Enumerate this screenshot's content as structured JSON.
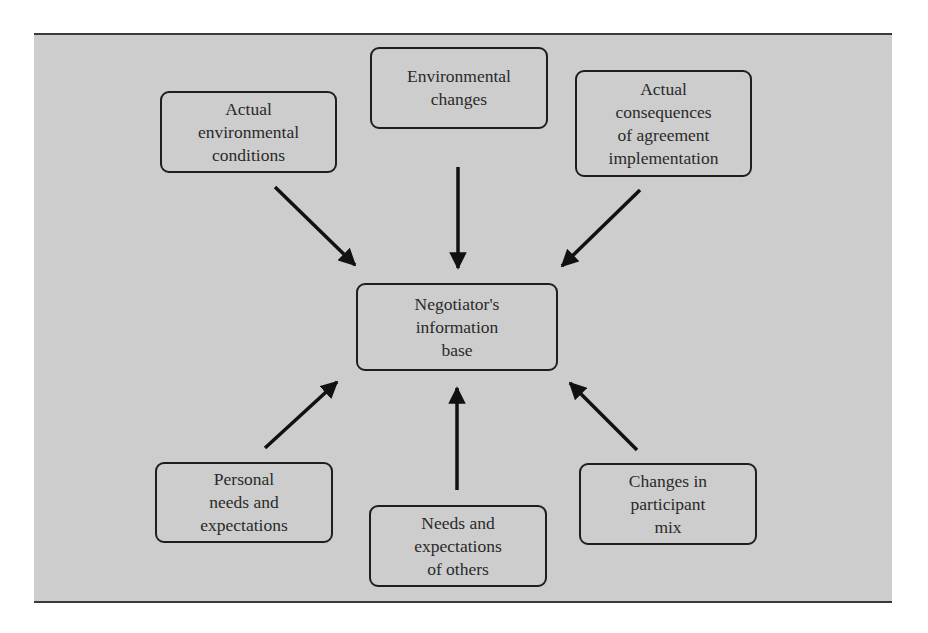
{
  "diagram": {
    "type": "hub-and-spoke flow diagram",
    "center": {
      "id": "info-base",
      "lines": [
        "Negotiator's",
        "information",
        "base"
      ]
    },
    "nodes": [
      {
        "id": "actual-env-conditions",
        "lines": [
          "Actual",
          "environmental",
          "conditions"
        ],
        "direction": "inbound"
      },
      {
        "id": "env-changes",
        "lines": [
          "Environmental",
          "changes"
        ],
        "direction": "inbound"
      },
      {
        "id": "actual-consequences",
        "lines": [
          "Actual",
          "consequences",
          "of agreement",
          "implementation"
        ],
        "direction": "inbound"
      },
      {
        "id": "personal-needs",
        "lines": [
          "Personal",
          "needs and",
          "expectations"
        ],
        "direction": "inbound"
      },
      {
        "id": "needs-of-others",
        "lines": [
          "Needs and",
          "expectations",
          "of others"
        ],
        "direction": "inbound"
      },
      {
        "id": "participant-mix",
        "lines": [
          "Changes in",
          "participant",
          "mix"
        ],
        "direction": "inbound"
      }
    ],
    "edges": [
      {
        "from": "actual-env-conditions",
        "to": "info-base"
      },
      {
        "from": "env-changes",
        "to": "info-base"
      },
      {
        "from": "actual-consequences",
        "to": "info-base"
      },
      {
        "from": "personal-needs",
        "to": "info-base"
      },
      {
        "from": "needs-of-others",
        "to": "info-base"
      },
      {
        "from": "participant-mix",
        "to": "info-base"
      }
    ],
    "colors": {
      "panel_bg": "#cdcdcd",
      "stroke": "#1e1e1e",
      "text": "#2a2a2a"
    }
  }
}
